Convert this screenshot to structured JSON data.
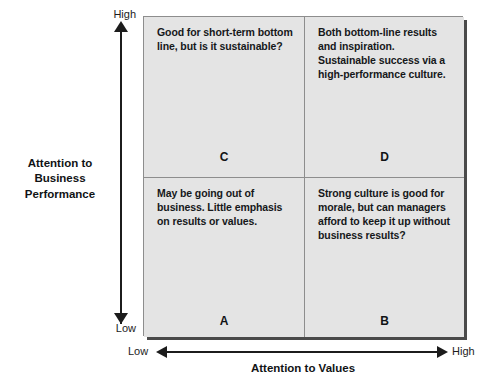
{
  "diagram": {
    "type": "2x2-matrix",
    "colors": {
      "quadrant_fill": "#e4e4e4",
      "border": "#8d8d8d",
      "shadow": "#4a4a4a",
      "text": "#111315",
      "axis": "#1c1c1c"
    },
    "y_axis": {
      "title": "Attention to\nBusiness\nPerformance",
      "title_line1": "Attention to",
      "title_line2": "Business",
      "title_line3": "Performance",
      "high_label": "High",
      "low_label": "Low"
    },
    "x_axis": {
      "title": "Attention to Values",
      "low_label": "Low",
      "high_label": "High"
    },
    "quadrants": [
      {
        "id": "C",
        "position": "top-left",
        "letter": "C",
        "text": "Good for short-term bottom line, but is it sustainable?"
      },
      {
        "id": "D",
        "position": "top-right",
        "letter": "D",
        "text": "Both bottom-line results and inspiration. Sustainable success via a high-performance culture."
      },
      {
        "id": "A",
        "position": "bottom-left",
        "letter": "A",
        "text": "May be going out of business. Little emphasis on results or values."
      },
      {
        "id": "B",
        "position": "bottom-right",
        "letter": "B",
        "text": "Strong culture is good for morale, but can managers afford to keep it up without business results?"
      }
    ]
  }
}
